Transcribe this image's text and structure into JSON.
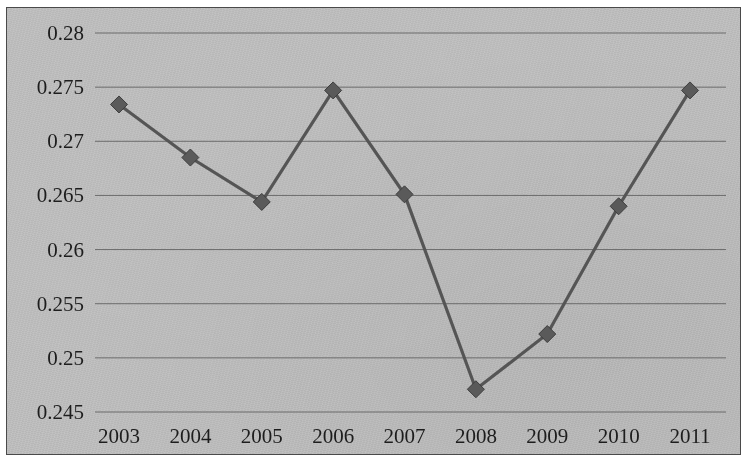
{
  "chart_data": {
    "type": "line",
    "title": "",
    "subtitle": "",
    "xlabel": "",
    "ylabel": "",
    "categories": [
      "2003",
      "2004",
      "2005",
      "2006",
      "2007",
      "2008",
      "2009",
      "2010",
      "2011"
    ],
    "values": [
      0.2734,
      0.2685,
      0.2644,
      0.2747,
      0.2651,
      0.2471,
      0.2522,
      0.264,
      0.2747
    ],
    "series": [
      {
        "name": "",
        "values": [
          0.2734,
          0.2685,
          0.2644,
          0.2747,
          0.2651,
          0.2471,
          0.2522,
          0.264,
          0.2747
        ]
      }
    ],
    "ylim": [
      0.245,
      0.28
    ],
    "ytick_labels": [
      "0.28",
      "0.275",
      "0.27",
      "0.265",
      "0.26",
      "0.255",
      "0.25",
      "0.245"
    ],
    "ytick_values": [
      0.28,
      0.275,
      0.27,
      0.265,
      0.26,
      0.255,
      0.25,
      0.245
    ],
    "xtick_labels": [
      "2003",
      "2004",
      "2005",
      "2006",
      "2007",
      "2008",
      "2009",
      "2010",
      "2011"
    ],
    "grid": "horizontal",
    "legend": "none",
    "marker": "diamond",
    "line_color": "#555555",
    "marker_color": "#5a5a5a",
    "grid_color": "#5d5d5d",
    "plot_background": "#c3c3c3",
    "annotations": []
  }
}
